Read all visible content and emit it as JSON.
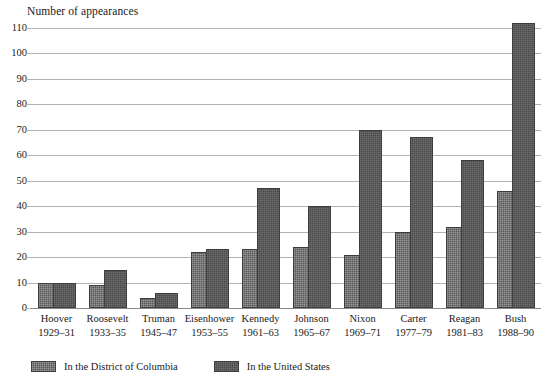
{
  "chart_data": {
    "type": "bar",
    "title": "Number of appearances",
    "xlabel": "",
    "ylabel": "Number of appearances",
    "ylim": [
      0,
      110
    ],
    "ytick_step": 10,
    "grid": true,
    "legend_position": "bottom-left",
    "categories": [
      "Hoover",
      "Roosevelt",
      "Truman",
      "Eisenhower",
      "Kennedy",
      "Johnson",
      "Nixon",
      "Carter",
      "Reagan",
      "Bush"
    ],
    "category_years": [
      "1929–31",
      "1933–35",
      "1945–47",
      "1953–55",
      "1961–63",
      "1965–67",
      "1969–71",
      "1977–79",
      "1981–83",
      "1988–90"
    ],
    "ytick_labels": [
      "0",
      "10",
      "20",
      "30",
      "40",
      "50",
      "60",
      "70",
      "80",
      "90",
      "100",
      "110"
    ],
    "series": [
      {
        "name": "In the District of Columbia",
        "color": "#585858",
        "values": [
          10,
          9,
          4,
          22,
          23,
          24,
          21,
          30,
          32,
          46
        ]
      },
      {
        "name": "In the United States",
        "color": "#4a4a4a",
        "values": [
          10,
          15,
          6,
          23,
          47,
          40,
          70,
          67,
          58,
          112
        ]
      }
    ]
  },
  "legend": {
    "items": [
      {
        "label": "In the District of Columbia",
        "swatch": "dc"
      },
      {
        "label": "In the United States",
        "swatch": "us"
      }
    ]
  }
}
